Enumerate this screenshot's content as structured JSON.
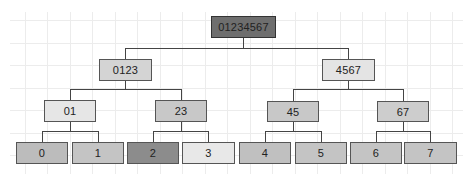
{
  "diagram": {
    "type": "binary-tree",
    "root": {
      "label": "01234567",
      "fill": "#6e6e6e"
    },
    "level1": [
      {
        "label": "0123",
        "fill": "#d4d4d4"
      },
      {
        "label": "4567",
        "fill": "#e4e4e4"
      }
    ],
    "level2": [
      {
        "label": "01",
        "fill": "#e6e6e6"
      },
      {
        "label": "23",
        "fill": "#c8c8c8"
      },
      {
        "label": "45",
        "fill": "#c8c8c8"
      },
      {
        "label": "67",
        "fill": "#cdcdcd"
      }
    ],
    "leaves": [
      {
        "label": "0",
        "fill": "#bcbcbc"
      },
      {
        "label": "1",
        "fill": "#c4c4c4"
      },
      {
        "label": "2",
        "fill": "#8c8c8c"
      },
      {
        "label": "3",
        "fill": "#e8e8e8"
      },
      {
        "label": "4",
        "fill": "#c0c0c0"
      },
      {
        "label": "5",
        "fill": "#c4c4c4"
      },
      {
        "label": "6",
        "fill": "#c4c4c4"
      },
      {
        "label": "7",
        "fill": "#c4c4c4"
      }
    ],
    "edge_color": "#444444",
    "grid_color": "#ececec"
  }
}
